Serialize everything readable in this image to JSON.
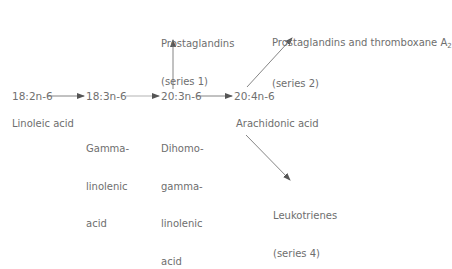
{
  "diagram": {
    "nodes": [
      {
        "id": "la",
        "code": "18:2n-6",
        "name": "Linoleic acid"
      },
      {
        "id": "gla",
        "code": "18:3n-6",
        "name_lines": [
          "Gamma-",
          "linolenic",
          "acid"
        ]
      },
      {
        "id": "dgla",
        "code": "20:3n-6",
        "name_lines": [
          "Dihomo-",
          "gamma-",
          "linolenic",
          "acid"
        ]
      },
      {
        "id": "aa",
        "code": "20:4n-6",
        "name": "Arachidonic acid"
      }
    ],
    "products": {
      "pg1": {
        "line1": "Prostaglandins",
        "line2": "(series 1)"
      },
      "pg2": {
        "line1": "Prostaglandins and thromboxane A",
        "sub": "2",
        "line2": "(series 2)"
      },
      "lt4": {
        "line1": "Leukotrienes",
        "line2": "(series 4)"
      }
    },
    "edges": [
      {
        "from": "18:2n-6",
        "to": "18:3n-6"
      },
      {
        "from": "18:3n-6",
        "to": "20:3n-6"
      },
      {
        "from": "20:3n-6",
        "to": "20:4n-6"
      },
      {
        "from": "20:3n-6",
        "to": "Prostaglandins (series 1)"
      },
      {
        "from": "20:4n-6",
        "to": "Prostaglandins and thromboxane A2 (series 2)"
      },
      {
        "from": "20:4n-6",
        "to": "Leukotrienes (series 4)"
      }
    ],
    "line_color": "#6e6e6e"
  }
}
